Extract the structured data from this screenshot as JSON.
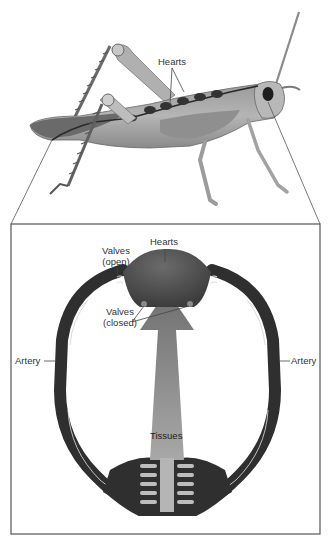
{
  "figure": {
    "top_panel": {
      "subject": "grasshopper",
      "labels": {
        "hearts": "Hearts"
      }
    },
    "detail_panel": {
      "labels": {
        "hearts": "Hearts",
        "valves_open_line1": "Valves",
        "valves_open_line2": "(open)",
        "valves_closed_line1": "Valves",
        "valves_closed_line2": "(closed)",
        "artery_left": "Artery",
        "artery_right": "Artery",
        "tissues": "Tissues"
      }
    },
    "colors": {
      "vessel": "#2f2f2f",
      "heart": "#4a4a4a",
      "tissue_arrow": "#8c8c8c",
      "box_border": "#555555",
      "label_text": "#333333"
    }
  }
}
